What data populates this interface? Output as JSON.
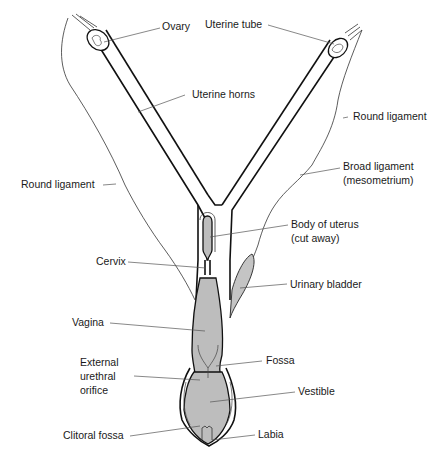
{
  "diagram": {
    "colors": {
      "background": "#ffffff",
      "outline": "#111111",
      "organ_fill": "#bdbdbd",
      "leader_line": "#555555",
      "label_text": "#1a1a1a"
    },
    "labels": {
      "ovary": "Ovary",
      "uterine_tube": "Uterine tube",
      "uterine_horns": "Uterine horns",
      "round_ligament_right": "Round ligament",
      "round_ligament_left": "Round ligament",
      "broad_ligament_line1": "Broad ligament",
      "broad_ligament_line2": "(mesometrium)",
      "body_of_uterus_line1": "Body of uterus",
      "body_of_uterus_line2": "(cut away)",
      "cervix": "Cervix",
      "urinary_bladder": "Urinary bladder",
      "vagina": "Vagina",
      "external_urethral_line1": "External",
      "external_urethral_line2": "urethral",
      "external_urethral_line3": "orifice",
      "fossa": "Fossa",
      "vestible": "Vestible",
      "clitoral_fossa": "Clitoral fossa",
      "labia": "Labia"
    }
  }
}
